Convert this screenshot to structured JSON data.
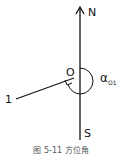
{
  "diagram": {
    "labels": {
      "north": "N",
      "south": "S",
      "origin": "O",
      "point": "1",
      "angle_symbol": "α",
      "angle_subscript": "O1"
    },
    "caption": "图 5-11 方位角",
    "colors": {
      "line": "#111111",
      "text": "#111111"
    }
  }
}
